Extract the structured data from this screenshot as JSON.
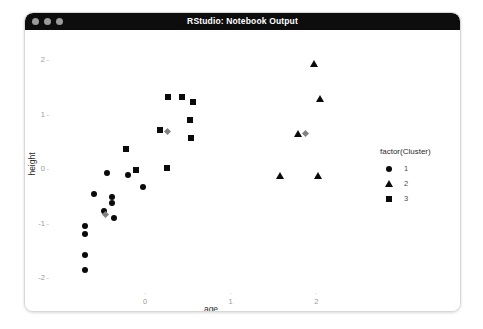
{
  "window": {
    "title": "RStudio: Notebook Output",
    "traffic_lights": [
      "close-button",
      "minimize-button",
      "zoom-button"
    ]
  },
  "chart_data": {
    "type": "scatter",
    "title": "",
    "xlabel": "age",
    "ylabel": "height",
    "xticks": [
      0,
      1,
      2
    ],
    "yticks": [
      2,
      1,
      0,
      -1,
      -2
    ],
    "xlim": [
      -1.05,
      2.45
    ],
    "ylim": [
      -2.25,
      2.3
    ],
    "grid": false,
    "legend": {
      "title": "factor(Cluster)",
      "position": "right",
      "entries": [
        {
          "label": "1",
          "marker": "circle"
        },
        {
          "label": "2",
          "marker": "triangle"
        },
        {
          "label": "3",
          "marker": "square"
        }
      ]
    },
    "series": [
      {
        "name": "1",
        "marker": "circle",
        "color": "#0a0a0a",
        "points": [
          {
            "x": -0.44,
            "y": -0.06
          },
          {
            "x": -0.2,
            "y": -0.11
          },
          {
            "x": -0.02,
            "y": -0.32
          },
          {
            "x": -0.6,
            "y": -0.45
          },
          {
            "x": -0.38,
            "y": -0.5
          },
          {
            "x": -0.38,
            "y": -0.62
          },
          {
            "x": -0.48,
            "y": -0.76
          },
          {
            "x": -0.36,
            "y": -0.89
          },
          {
            "x": -0.7,
            "y": -1.04
          },
          {
            "x": -0.7,
            "y": -1.19
          },
          {
            "x": -0.7,
            "y": -1.58
          },
          {
            "x": -0.7,
            "y": -1.85
          }
        ]
      },
      {
        "name": "2",
        "marker": "triangle",
        "color": "#0a0a0a",
        "points": [
          {
            "x": 1.97,
            "y": 1.94
          },
          {
            "x": 2.04,
            "y": 1.3
          },
          {
            "x": 1.78,
            "y": 0.66
          },
          {
            "x": 1.57,
            "y": -0.11
          },
          {
            "x": 2.02,
            "y": -0.11
          }
        ]
      },
      {
        "name": "3",
        "marker": "square",
        "color": "#0a0a0a",
        "points": [
          {
            "x": 0.27,
            "y": 1.33
          },
          {
            "x": 0.43,
            "y": 1.33
          },
          {
            "x": 0.56,
            "y": 1.23
          },
          {
            "x": 0.53,
            "y": 0.9
          },
          {
            "x": 0.17,
            "y": 0.73
          },
          {
            "x": 0.54,
            "y": 0.57
          },
          {
            "x": -0.22,
            "y": 0.38
          },
          {
            "x": 0.26,
            "y": 0.02
          },
          {
            "x": -0.1,
            "y": -0.02
          }
        ]
      },
      {
        "name": "centroids",
        "marker": "diamond",
        "color": "#828282",
        "points": [
          {
            "x": 0.26,
            "y": 0.7
          },
          {
            "x": -0.46,
            "y": -0.83
          },
          {
            "x": 1.87,
            "y": 0.66
          }
        ]
      }
    ]
  }
}
